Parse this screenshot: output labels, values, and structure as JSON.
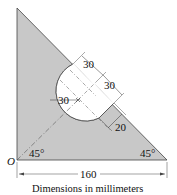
{
  "diagram": {
    "type": "engineering-plate",
    "origin_label": "O",
    "angles": {
      "left": "45°",
      "right": "45°"
    },
    "dimensions": {
      "base": "160",
      "hole_radius": "30",
      "upper_offset_1": "30",
      "upper_offset_2": "30",
      "lower_offset": "20"
    },
    "caption": "Dimensions in millimeters",
    "colors": {
      "plate_fill": "#c8c8c8",
      "outline": "#333333",
      "background": "#ffffff"
    }
  }
}
